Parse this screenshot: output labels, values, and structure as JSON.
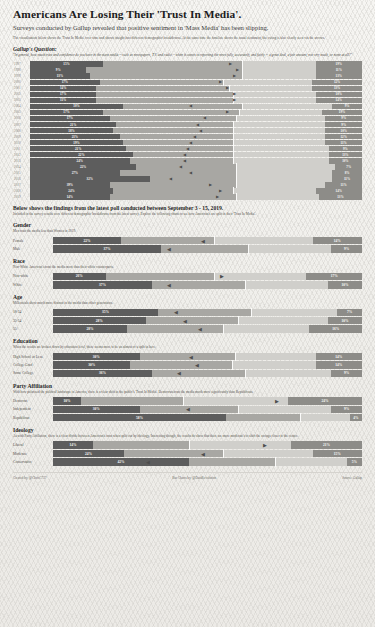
{
  "header": {
    "title": "Americans Are Losing Their 'Trust In Media'.",
    "subtitle": "Surveys conducted by Gallup revealed that positive sentiment in 'Mass Media' has been slipping.",
    "intro": "The visualisation below shows the 'Trust In Media' over time and shows insight into different demographic breakdowns. At the same time the timeline shows the usual sentiment, the swing is also clearly seen via the arrows."
  },
  "gallup": {
    "heading": "Gallup's Question:",
    "question": "\"In general, how much trust and confidence do you have in the mass media -- such as newspapers, T.V. and radio -- when it comes to reporting the news fully, accurately, and fairly -- a great deal, a fair amount, not very much, or none at all?\""
  },
  "annotation": "The Advent of\n\"Fake News\"",
  "colors": {
    "negative": "#5d5d5d",
    "mid": "#a8a7a3",
    "light": "#d0cfcb",
    "positive": "#8d8c88",
    "paper": "#f4f3f0"
  },
  "chart_data": {
    "type": "bar",
    "xlabel": "",
    "ylabel": "Year",
    "categories": [
      "1997",
      "1998",
      "1999",
      "2000",
      "2001",
      "2002",
      "2003",
      "2004",
      "2005",
      "2006",
      "2007",
      "2008",
      "2009",
      "2010",
      "2011",
      "2012",
      "2013",
      "2014",
      "2015",
      "2016",
      "2017",
      "2018",
      "2019"
    ],
    "series": [
      {
        "name": "Negative (left)",
        "values": [
          15,
          9,
          13,
          17,
          14,
          17,
          11,
          10,
          17,
          17,
          21,
          18,
          21,
          19,
          21,
          22,
          24,
          22,
          27,
          32,
          39,
          24,
          14
        ]
      },
      {
        "name": "Positive (right)",
        "values": [
          19,
          11,
          13,
          13,
          12,
          13,
          10,
          14,
          9,
          19,
          9,
          9,
          10,
          12,
          11,
          9,
          13,
          10,
          7,
          8,
          11,
          14,
          13
        ]
      }
    ],
    "rows": [
      {
        "year": "1997",
        "negative": 15,
        "positive": 19,
        "leftPct": 22,
        "midPct": 42,
        "lightPct": 22,
        "posPct": 14,
        "marker": "right",
        "markerPos": 60
      },
      {
        "year": "1998",
        "negative": 9,
        "positive": 11,
        "leftPct": 17,
        "midPct": 47,
        "lightPct": 22,
        "posPct": 14,
        "marker": "right",
        "markerPos": 62
      },
      {
        "year": "1999",
        "negative": 13,
        "positive": 13,
        "leftPct": 18,
        "midPct": 46,
        "lightPct": 22,
        "posPct": 14,
        "marker": "right",
        "markerPos": 61
      },
      {
        "year": "2000",
        "negative": 17,
        "positive": 12,
        "leftPct": 21,
        "midPct": 37,
        "lightPct": 27,
        "posPct": 15,
        "marker": "right",
        "markerPos": 57
      },
      {
        "year": "2001",
        "negative": 14,
        "positive": 13,
        "leftPct": 20,
        "midPct": 40,
        "lightPct": 25,
        "posPct": 15,
        "marker": "right",
        "markerPos": 59
      },
      {
        "year": "2002",
        "negative": 17,
        "positive": 10,
        "leftPct": 20,
        "midPct": 41,
        "lightPct": 25,
        "posPct": 14,
        "marker": "right",
        "markerPos": 61
      },
      {
        "year": "2003",
        "negative": 11,
        "positive": 14,
        "leftPct": 20,
        "midPct": 41,
        "lightPct": 25,
        "posPct": 14,
        "marker": "right",
        "markerPos": 61
      },
      {
        "year": "2004",
        "negative": 10,
        "positive": 9,
        "leftPct": 28,
        "midPct": 36,
        "lightPct": 27,
        "posPct": 9,
        "marker": "left",
        "markerPos": 48
      },
      {
        "year": "2005",
        "negative": 17,
        "positive": 19,
        "leftPct": 22,
        "midPct": 41,
        "lightPct": 25,
        "posPct": 12,
        "marker": "right",
        "markerPos": 59
      },
      {
        "year": "2006",
        "negative": 17,
        "positive": 9,
        "leftPct": 24,
        "midPct": 38,
        "lightPct": 27,
        "posPct": 11,
        "marker": "left",
        "markerPos": 52
      },
      {
        "year": "2007",
        "negative": 21,
        "positive": 9,
        "leftPct": 26,
        "midPct": 35,
        "lightPct": 28,
        "posPct": 11,
        "marker": "left",
        "markerPos": 50
      },
      {
        "year": "2008",
        "negative": 18,
        "positive": 10,
        "leftPct": 25,
        "midPct": 36,
        "lightPct": 28,
        "posPct": 11,
        "marker": "left",
        "markerPos": 51
      },
      {
        "year": "2009",
        "negative": 21,
        "positive": 12,
        "leftPct": 27,
        "midPct": 34,
        "lightPct": 28,
        "posPct": 11,
        "marker": "left",
        "markerPos": 49
      },
      {
        "year": "2010",
        "negative": 19,
        "positive": 11,
        "leftPct": 28,
        "midPct": 33,
        "lightPct": 28,
        "posPct": 11,
        "marker": "left",
        "markerPos": 48
      },
      {
        "year": "2011",
        "negative": 21,
        "positive": 9,
        "leftPct": 29,
        "midPct": 32,
        "lightPct": 29,
        "posPct": 10,
        "marker": "left",
        "markerPos": 47
      },
      {
        "year": "2012",
        "negative": 22,
        "positive": 13,
        "leftPct": 31,
        "midPct": 30,
        "lightPct": 29,
        "posPct": 10,
        "marker": "left",
        "markerPos": 46
      },
      {
        "year": "2013",
        "negative": 24,
        "positive": 10,
        "leftPct": 30,
        "midPct": 31,
        "lightPct": 29,
        "posPct": 10,
        "marker": "left",
        "markerPos": 46
      },
      {
        "year": "2014",
        "negative": 22,
        "positive": 7,
        "leftPct": 32,
        "midPct": 30,
        "lightPct": 30,
        "posPct": 8,
        "marker": "left",
        "markerPos": 45
      },
      {
        "year": "2015",
        "negative": 27,
        "positive": 8,
        "leftPct": 27,
        "midPct": 35,
        "lightPct": 29,
        "posPct": 9,
        "marker": "left",
        "markerPos": 48
      },
      {
        "year": "2016",
        "negative": 32,
        "positive": 11,
        "leftPct": 36,
        "midPct": 26,
        "lightPct": 29,
        "posPct": 9,
        "marker": "left",
        "markerPos": 42
      },
      {
        "year": "2017",
        "negative": 39,
        "positive": 11,
        "leftPct": 24,
        "midPct": 38,
        "lightPct": 27,
        "posPct": 11,
        "marker": "right",
        "markerPos": 54
      },
      {
        "year": "2018",
        "negative": 24,
        "positive": 14,
        "leftPct": 25,
        "midPct": 36,
        "lightPct": 25,
        "posPct": 14,
        "marker": "right",
        "markerPos": 57
      },
      {
        "year": "2019",
        "negative": 14,
        "positive": 13,
        "leftPct": 24,
        "midPct": 38,
        "lightPct": 25,
        "posPct": 13,
        "marker": "right",
        "markerPos": 56
      }
    ]
  },
  "latest": {
    "heading": "Below shows the findings from the latest poll conducted between September 3 - 15, 2019.",
    "sub": "Included in the survey results were different demographic breakdowns from the latest survey. Explore the following charts to see how American's are split in their 'Trust In Media'."
  },
  "sections": [
    {
      "name": "Gender",
      "sub": "Men trust the media less than Women in 2019.",
      "rows": [
        {
          "label": "Female",
          "value": "22%",
          "right": "14%",
          "leftPct": 22,
          "midPct": 30,
          "lightPct": 32,
          "posPct": 16,
          "marker": "left",
          "markerPos": 48
        },
        {
          "label": "Male",
          "value": "37%",
          "right": "9%",
          "leftPct": 35,
          "midPct": 28,
          "lightPct": 27,
          "posPct": 10,
          "marker": "left",
          "markerPos": 37
        }
      ]
    },
    {
      "name": "Race",
      "sub": "Non-White American's trust the media more than their white counterparts.",
      "rows": [
        {
          "label": "Non-white",
          "value": "26%",
          "right": "17%",
          "leftPct": 17,
          "midPct": 35,
          "lightPct": 30,
          "posPct": 18,
          "marker": "right",
          "markerPos": 54
        },
        {
          "label": "White",
          "value": "37%",
          "right": "10%",
          "leftPct": 32,
          "midPct": 30,
          "lightPct": 27,
          "posPct": 11,
          "marker": "left",
          "markerPos": 37
        }
      ]
    },
    {
      "name": "Age",
      "sub": "Millennials show much more distrust in the media than other generations.",
      "rows": [
        {
          "label": "18-34",
          "value": "35%",
          "right": "7%",
          "leftPct": 34,
          "midPct": 30,
          "lightPct": 28,
          "posPct": 8,
          "marker": "left",
          "markerPos": 39
        },
        {
          "label": "35-54",
          "value": "28%",
          "right": "10%",
          "leftPct": 30,
          "midPct": 30,
          "lightPct": 29,
          "posPct": 11,
          "marker": "left",
          "markerPos": 42
        },
        {
          "label": "55+",
          "value": "28%",
          "right": "16%",
          "leftPct": 24,
          "midPct": 31,
          "lightPct": 28,
          "posPct": 17,
          "marker": "left",
          "markerPos": 47
        }
      ]
    },
    {
      "name": "Education",
      "sub": "When the results are broken down by education level, there seems more to be an almost of a split in here.",
      "rows": [
        {
          "label": "High School or Less",
          "value": "30%",
          "right": "14%",
          "leftPct": 28,
          "midPct": 31,
          "lightPct": 26,
          "posPct": 15,
          "marker": "left",
          "markerPos": 44
        },
        {
          "label": "College Grad",
          "value": "30%",
          "right": "14%",
          "leftPct": 25,
          "midPct": 33,
          "lightPct": 27,
          "posPct": 15,
          "marker": "left",
          "markerPos": 46
        },
        {
          "label": "Some College",
          "value": "36%",
          "right": "9%",
          "leftPct": 32,
          "midPct": 30,
          "lightPct": 28,
          "posPct": 10,
          "marker": "left",
          "markerPos": 40
        }
      ]
    },
    {
      "name": "Party Affiliation",
      "sub": "With how polarised the political landscape in America, there is a clear shift in the public's 'Trust In Media'. Democrats trust the media much more significantly than Republicans.",
      "rows": [
        {
          "label": "Democrat",
          "value": "10%",
          "right": "24%",
          "leftPct": 9,
          "midPct": 33,
          "lightPct": 34,
          "posPct": 24,
          "marker": "right",
          "markerPos": 72
        },
        {
          "label": "Independent",
          "value": "30%",
          "right": "9%",
          "leftPct": 28,
          "midPct": 32,
          "lightPct": 30,
          "posPct": 10,
          "marker": "left",
          "markerPos": 43
        },
        {
          "label": "Republican",
          "value": "58%",
          "right": "4%",
          "leftPct": 56,
          "midPct": 24,
          "lightPct": 16,
          "posPct": 4,
          "marker": "none",
          "markerPos": 0
        }
      ]
    },
    {
      "name": "Ideology",
      "sub": "As with Party Affiliation, there is a clear divide between American's trust when split out by ideology. Interesting though, the results do show that there are more moderate's to shift the swings closer to the center.",
      "rows": [
        {
          "label": "Liberal",
          "value": "14%",
          "right": "21%",
          "leftPct": 13,
          "midPct": 31,
          "lightPct": 33,
          "posPct": 23,
          "marker": "right",
          "markerPos": 68
        },
        {
          "label": "Moderate",
          "value": "24%",
          "right": "15%",
          "leftPct": 23,
          "midPct": 32,
          "lightPct": 29,
          "posPct": 16,
          "marker": "left",
          "markerPos": 48
        },
        {
          "label": "Conservative",
          "value": "42%",
          "right": "5%",
          "leftPct": 44,
          "midPct": 28,
          "lightPct": 23,
          "posPct": 5,
          "marker": "left",
          "markerPos": 30
        }
      ]
    }
  ],
  "footer": {
    "created": "Created by: @ChrisC737",
    "middle": "Bar Charts by: @DataRevolution",
    "source": "Source: Gallup"
  }
}
